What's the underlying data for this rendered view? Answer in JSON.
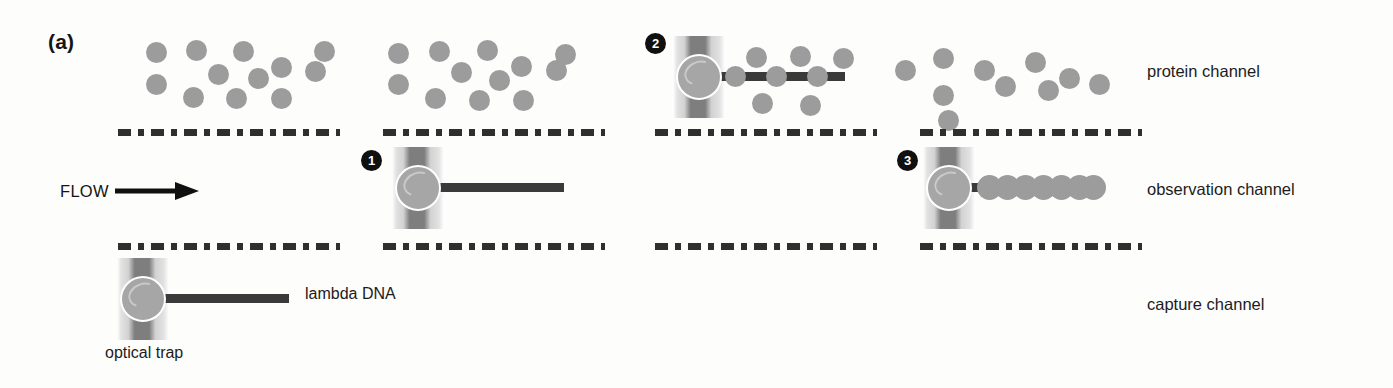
{
  "figure": {
    "panel_letter": "(a)",
    "background_color": "#fdfdfc",
    "protein_color": "#9c9c9c",
    "dna_color": "#3a3a3a",
    "bead_color": "#a6a6a6",
    "trap_beam_color": "#7e7e7e",
    "divider_color": "#2f2f2f",
    "badge_color": "#101010"
  },
  "channels": [
    {
      "id": "protein-channel",
      "label": "protein channel"
    },
    {
      "id": "observation-channel",
      "label": "observation channel"
    },
    {
      "id": "capture-channel",
      "label": "capture channel"
    }
  ],
  "flow": {
    "label": "FLOW",
    "arrow_icon": "arrow-right-icon",
    "direction": "right"
  },
  "annotations": {
    "optical_trap": "optical trap",
    "lambda_dna": "lambda DNA"
  },
  "steps": [
    {
      "number": "1",
      "description": "DNA tethered to trapped bead in observation channel"
    },
    {
      "number": "2",
      "description": "DNA moved into protein channel, proteins begin binding"
    },
    {
      "number": "3",
      "description": "Fully coated DNA returned to observation channel"
    }
  ],
  "columns": [
    {
      "id": "column-capture",
      "protein_cloud_count": 12,
      "trap_present": true,
      "trap_channel": "capture-channel",
      "bound_protein_count": 0,
      "step_badge": null
    },
    {
      "id": "column-step-1",
      "protein_cloud_count": 12,
      "trap_present": true,
      "trap_channel": "observation-channel",
      "bound_protein_count": 0,
      "step_badge": "1"
    },
    {
      "id": "column-step-2",
      "protein_cloud_count": 6,
      "trap_present": true,
      "trap_channel": "protein-channel",
      "bound_protein_count": 3,
      "step_badge": "2"
    },
    {
      "id": "column-step-3",
      "protein_cloud_count": 10,
      "trap_present": true,
      "trap_channel": "observation-channel",
      "bound_protein_count": 7,
      "step_badge": "3"
    }
  ]
}
